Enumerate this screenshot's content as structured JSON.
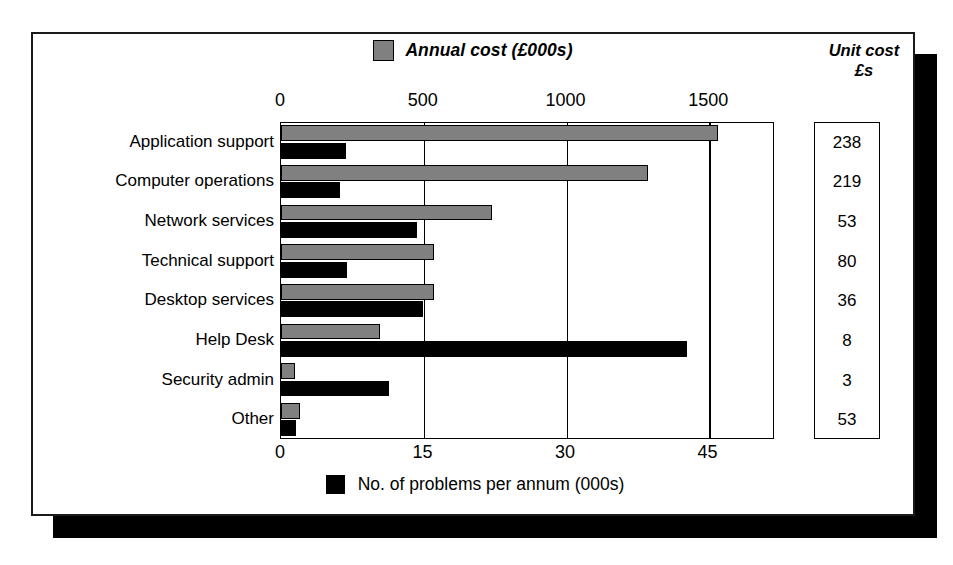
{
  "legend_top": {
    "label": "Annual cost (£000s)",
    "swatch_name": "gray-swatch",
    "color": "#808080"
  },
  "legend_bottom": {
    "label": "No. of problems per annum (000s)",
    "swatch_name": "black-swatch",
    "color": "#000000"
  },
  "unit_cost_header": {
    "line1": "Unit cost",
    "line2": "£s"
  },
  "chart_data": {
    "type": "bar",
    "orientation": "horizontal",
    "title": "",
    "grid": true,
    "legend_position": "top-center and bottom-center",
    "categories": [
      "Application support",
      "Computer operations",
      "Network services",
      "Technical support",
      "Desktop services",
      "Help Desk",
      "Security admin",
      "Other"
    ],
    "series": [
      {
        "name": "Annual cost (£000s)",
        "color": "#808080",
        "axis": "top",
        "values": [
          1530,
          1285,
          740,
          535,
          535,
          345,
          50,
          65
        ]
      },
      {
        "name": "No. of problems per annum (000s)",
        "color": "#000000",
        "axis": "bottom",
        "values": [
          6.8,
          6.2,
          14.3,
          6.9,
          14.9,
          42.7,
          11.4,
          1.6
        ]
      }
    ],
    "top_axis": {
      "label": "Annual cost (£000s)",
      "ticks": [
        0,
        500,
        1000,
        1500
      ],
      "lim": [
        0,
        1730
      ]
    },
    "bottom_axis": {
      "label": "No. of problems per annum (000s)",
      "ticks": [
        0,
        15,
        30,
        45
      ],
      "lim": [
        0,
        52
      ]
    },
    "tick_labels_top": [
      "0",
      "500",
      "1000",
      "1500"
    ],
    "tick_labels_bottom": [
      "0",
      "15",
      "30",
      "45"
    ],
    "side_table": {
      "header": "Unit cost £s",
      "values": [
        "238",
        "219",
        "53",
        "80",
        "36",
        "8",
        "3",
        "53"
      ]
    }
  }
}
